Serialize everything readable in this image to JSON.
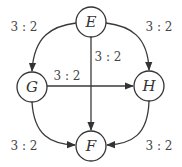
{
  "diagram": {
    "type": "directed-graph",
    "nodes": [
      {
        "id": "E",
        "label": "E",
        "x": 91,
        "y": 22
      },
      {
        "id": "G",
        "label": "G",
        "x": 32,
        "y": 87
      },
      {
        "id": "H",
        "label": "H",
        "x": 149,
        "y": 86
      },
      {
        "id": "F",
        "label": "F",
        "x": 91,
        "y": 146
      }
    ],
    "edges": [
      {
        "from": "E",
        "to": "G",
        "label": "3 : 2"
      },
      {
        "from": "E",
        "to": "H",
        "label": "3 : 2"
      },
      {
        "from": "E",
        "to": "F",
        "label": "3 : 2"
      },
      {
        "from": "G",
        "to": "H",
        "label": "3 : 2"
      },
      {
        "from": "G",
        "to": "F",
        "label": "3 : 2"
      },
      {
        "from": "H",
        "to": "F",
        "label": "3 : 2"
      }
    ]
  },
  "colors": {
    "stroke": "#333333",
    "background": "#ffffff"
  }
}
